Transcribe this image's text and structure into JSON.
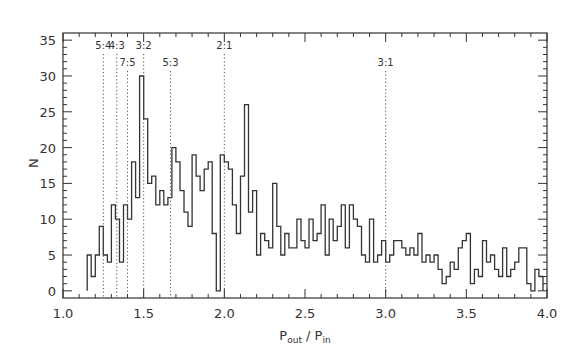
{
  "chart_data": {
    "type": "bar",
    "style": "step-histogram",
    "title": "",
    "xlabel": "P_out / P_in",
    "xlabel_parts": {
      "main1": "P",
      "sub1": "out",
      "sep": " / ",
      "main2": "P",
      "sub2": "in"
    },
    "ylabel": "N",
    "xlim": [
      1.0,
      4.0
    ],
    "ylim": [
      -1,
      36
    ],
    "xticks": [
      1.0,
      1.5,
      2.0,
      2.5,
      3.0,
      3.5,
      4.0
    ],
    "xtick_labels": [
      "1.0",
      "1.5",
      "2.0",
      "2.5",
      "3.0",
      "3.5",
      "4.0"
    ],
    "yticks": [
      0,
      5,
      10,
      15,
      20,
      25,
      30,
      35
    ],
    "ytick_labels": [
      "0",
      "5",
      "10",
      "15",
      "20",
      "25",
      "30",
      "35"
    ],
    "grid": false,
    "bin_start": 1.15,
    "bin_width": 0.025,
    "values": [
      5,
      2,
      5,
      9,
      5,
      4,
      12,
      10,
      4,
      12,
      10,
      18,
      13,
      30,
      24,
      15,
      16,
      12,
      14,
      12,
      13,
      20,
      18,
      14,
      11,
      9,
      19,
      16,
      14,
      17,
      18,
      8,
      0,
      19,
      18,
      17,
      12,
      8,
      16,
      26,
      11,
      14,
      5,
      8,
      7,
      6,
      15,
      9,
      5,
      8,
      6,
      6,
      10,
      7,
      6,
      10,
      7,
      8,
      12,
      5,
      10,
      7,
      9,
      12,
      6,
      12,
      10,
      9,
      5,
      4,
      10,
      4,
      5,
      7,
      4,
      5,
      7,
      7,
      6,
      5,
      6,
      5,
      8,
      4,
      5,
      4,
      5,
      3,
      1,
      2,
      4,
      3,
      6,
      7,
      8,
      1,
      3,
      2,
      7,
      4,
      5,
      3,
      2,
      6,
      2,
      3,
      4,
      6,
      6,
      1,
      0,
      3,
      2
    ],
    "resonances": [
      {
        "label": "5:4",
        "x": 1.25,
        "label_row": 1
      },
      {
        "label": "4:3",
        "x": 1.3333,
        "label_row": 1
      },
      {
        "label": "7:5",
        "x": 1.4,
        "label_row": 2
      },
      {
        "label": "3:2",
        "x": 1.5,
        "label_row": 1
      },
      {
        "label": "5:3",
        "x": 1.6667,
        "label_row": 2
      },
      {
        "label": "2:1",
        "x": 2.0,
        "label_row": 1
      },
      {
        "label": "3:1",
        "x": 3.0,
        "label_row": 2
      }
    ],
    "colors": {
      "line": "#333333",
      "dotted": "#555555",
      "text": "#333333"
    }
  }
}
